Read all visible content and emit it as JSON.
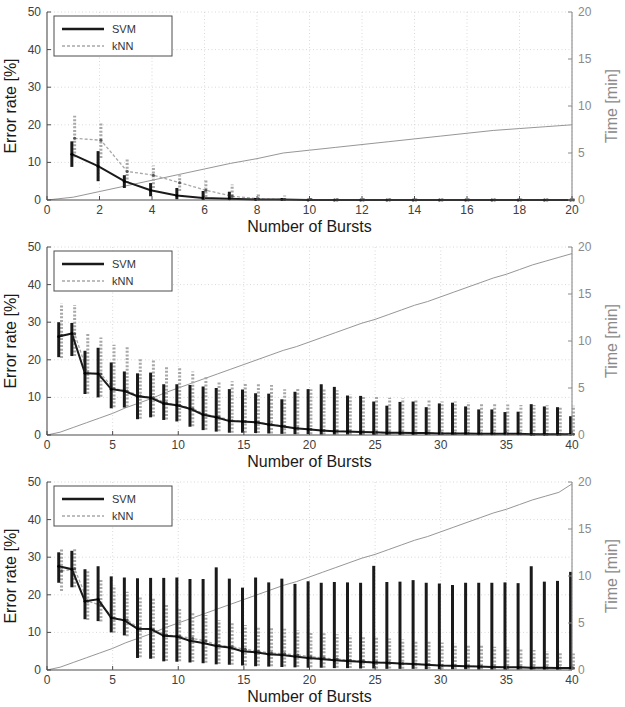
{
  "figure": {
    "panel_count": 3,
    "colors": {
      "svm": "#1a1a1a",
      "knn": "#a8a8a8",
      "time_line": "#8a8a8a",
      "grid": "#cfcfcf",
      "axis": "#4d4d4d",
      "right_axis_text": "#8a8a8a",
      "background": "#ffffff"
    }
  },
  "legend": {
    "entries": [
      {
        "label": "SVM",
        "style": "solid-thick",
        "color": "#1a1a1a"
      },
      {
        "label": "kNN",
        "style": "dashed-thin",
        "color": "#a8a8a8"
      }
    ]
  },
  "axes": {
    "ylabel": "Error rate [%]",
    "xlabel": "Number of Bursts",
    "ylabel_right": "Time [min]",
    "yticks": [
      "0",
      "10",
      "20",
      "30",
      "40",
      "50"
    ],
    "yticks_right": [
      "0",
      "5",
      "10",
      "15",
      "20"
    ],
    "ylim": [
      0,
      50
    ],
    "ylim_right": [
      0,
      20
    ]
  },
  "chart_data": [
    {
      "type": "line",
      "panel_index": 0,
      "title": "",
      "xlabel": "Number of Bursts",
      "ylabel": "Error rate [%]",
      "ylabel_right": "Time [min]",
      "xlim": [
        0,
        20
      ],
      "ylim": [
        0,
        50
      ],
      "ylim_right": [
        0,
        20
      ],
      "xticks": [
        0,
        2,
        4,
        6,
        8,
        10,
        12,
        14,
        16,
        18,
        20
      ],
      "yticks": [
        0,
        10,
        20,
        30,
        40,
        50
      ],
      "yticks_right": [
        0,
        5,
        10,
        15,
        20
      ],
      "grid": true,
      "legend_position": "top-left",
      "x": [
        1,
        2,
        3,
        4,
        5,
        6,
        7,
        8,
        9,
        10,
        11,
        12,
        13,
        14,
        15,
        16,
        17,
        18,
        19,
        20
      ],
      "series": [
        {
          "name": "SVM",
          "color": "#1a1a1a",
          "values": [
            12.2,
            9.0,
            5.0,
            2.6,
            1.2,
            0.5,
            0.3,
            0.1,
            0.1,
            0.0,
            0.0,
            0.0,
            0.0,
            0.0,
            0.0,
            0.0,
            0.0,
            0.0,
            0.0,
            0.0
          ],
          "err_low": [
            8.8,
            5.0,
            3.2,
            1.0,
            0.2,
            0.0,
            0.0,
            0.0,
            0.0,
            0.0,
            0.0,
            0.0,
            0.0,
            0.0,
            0.0,
            0.0,
            0.0,
            0.0,
            0.0,
            0.0
          ],
          "err_high": [
            15.6,
            13.0,
            6.6,
            4.5,
            3.2,
            2.4,
            2.2,
            0.5,
            0.4,
            0.3,
            0.2,
            0.2,
            0.2,
            0.2,
            0.2,
            0.2,
            0.2,
            0.2,
            0.2,
            0.2
          ]
        },
        {
          "name": "kNN",
          "color": "#a8a8a8",
          "values": [
            16.4,
            15.9,
            7.6,
            6.6,
            4.6,
            2.6,
            1.0,
            0.3,
            0.1,
            0.1,
            0.0,
            0.0,
            0.0,
            0.0,
            0.0,
            0.0,
            0.0,
            0.0,
            0.0,
            0.0
          ],
          "err_low": [
            11.4,
            11.2,
            4.5,
            3.2,
            2.4,
            0.8,
            0.1,
            0.0,
            0.0,
            0.0,
            0.0,
            0.0,
            0.0,
            0.0,
            0.0,
            0.0,
            0.0,
            0.0,
            0.0,
            0.0
          ],
          "err_high": [
            22.4,
            20.6,
            10.9,
            9.2,
            6.6,
            5.6,
            4.1,
            1.9,
            1.2,
            0.9,
            0.6,
            0.5,
            0.5,
            0.4,
            0.4,
            0.4,
            0.4,
            0.4,
            0.4,
            0.4
          ]
        },
        {
          "name": "Time",
          "color": "#8a8a8a",
          "axis": "right",
          "values": [
            0.3,
            0.9,
            1.5,
            2.1,
            2.7,
            3.3,
            3.9,
            4.4,
            5.0,
            5.3,
            5.6,
            5.9,
            6.2,
            6.5,
            6.8,
            7.1,
            7.4,
            7.6,
            7.8,
            8.0
          ]
        }
      ]
    },
    {
      "type": "line",
      "panel_index": 1,
      "title": "",
      "xlabel": "Number of Bursts",
      "ylabel": "Error rate [%]",
      "ylabel_right": "Time [min]",
      "xlim": [
        0,
        40
      ],
      "ylim": [
        0,
        50
      ],
      "ylim_right": [
        0,
        20
      ],
      "xticks": [
        0,
        5,
        10,
        15,
        20,
        25,
        30,
        35,
        40
      ],
      "yticks": [
        0,
        10,
        20,
        30,
        40,
        50
      ],
      "yticks_right": [
        0,
        5,
        10,
        15,
        20
      ],
      "grid": true,
      "legend_position": "top-left",
      "x": [
        1,
        2,
        3,
        4,
        5,
        6,
        7,
        8,
        9,
        10,
        11,
        12,
        13,
        14,
        15,
        16,
        17,
        18,
        19,
        20,
        21,
        22,
        23,
        24,
        25,
        26,
        27,
        28,
        29,
        30,
        31,
        32,
        33,
        34,
        35,
        36,
        37,
        38,
        39,
        40
      ],
      "series": [
        {
          "name": "SVM",
          "color": "#1a1a1a",
          "values": [
            26.2,
            27.0,
            16.4,
            16.3,
            12.2,
            11.7,
            10.3,
            9.9,
            8.4,
            7.9,
            7.0,
            5.4,
            4.7,
            3.7,
            3.6,
            3.4,
            2.8,
            2.3,
            1.8,
            1.5,
            1.2,
            1.0,
            0.9,
            0.8,
            0.7,
            0.6,
            0.6,
            0.5,
            0.5,
            0.4,
            0.4,
            0.4,
            0.3,
            0.3,
            0.3,
            0.3,
            0.2,
            0.2,
            0.2,
            0.2
          ],
          "err_low": [
            20.7,
            21.0,
            10.9,
            10.0,
            7.1,
            7.3,
            4.2,
            4.7,
            4.0,
            3.6,
            2.2,
            1.3,
            0.9,
            0.6,
            0.6,
            0.5,
            0.4,
            0.3,
            0.2,
            0.2,
            0.1,
            0.1,
            0.1,
            0.0,
            0.0,
            0.0,
            0.0,
            0.0,
            0.0,
            0.0,
            0.0,
            0.0,
            0.0,
            0.0,
            0.0,
            0.0,
            0.0,
            0.0,
            0.0,
            0.0
          ],
          "err_high": [
            30.0,
            29.8,
            22.4,
            23.2,
            19.3,
            16.9,
            16.4,
            16.6,
            13.5,
            13.5,
            13.3,
            12.9,
            12.5,
            12.2,
            12.1,
            11.1,
            11.0,
            9.5,
            11.5,
            12.2,
            13.5,
            12.8,
            10.5,
            10.4,
            8.9,
            7.8,
            8.8,
            8.9,
            7.4,
            8.4,
            8.6,
            7.6,
            6.8,
            6.8,
            6.1,
            6.2,
            8.2,
            7.6,
            7.4,
            5.0
          ]
        },
        {
          "name": "kNN",
          "color": "#a8a8a8",
          "values": [
            26.5,
            26.9,
            16.5,
            16.2,
            12.3,
            11.7,
            10.4,
            9.9,
            8.5,
            7.9,
            7.0,
            5.4,
            4.8,
            3.8,
            3.6,
            3.4,
            2.8,
            2.3,
            1.8,
            1.5,
            1.2,
            1.0,
            0.9,
            0.8,
            0.7,
            0.6,
            0.6,
            0.5,
            0.5,
            0.4,
            0.4,
            0.4,
            0.3,
            0.3,
            0.3,
            0.3,
            0.2,
            0.2,
            0.2,
            0.2
          ],
          "err_low": [
            20.5,
            21.0,
            11.0,
            10.2,
            7.4,
            7.5,
            4.3,
            4.9,
            4.1,
            3.8,
            2.3,
            1.4,
            1.0,
            0.6,
            0.6,
            0.5,
            0.4,
            0.3,
            0.2,
            0.2,
            0.1,
            0.1,
            0.1,
            0.0,
            0.0,
            0.0,
            0.0,
            0.0,
            0.0,
            0.0,
            0.0,
            0.0,
            0.0,
            0.0,
            0.0,
            0.0,
            0.0,
            0.0,
            0.0,
            0.0
          ],
          "err_high": [
            34.9,
            34.6,
            27.0,
            25.9,
            24.0,
            23.5,
            20.3,
            19.8,
            18.2,
            18.0,
            16.9,
            15.5,
            14.3,
            14.3,
            14.0,
            13.8,
            13.3,
            12.2,
            12.4,
            12.2,
            12.4,
            11.9,
            10.7,
            10.5,
            10.3,
            9.9,
            9.7,
            9.6,
            9.2,
            8.9,
            8.9,
            8.7,
            8.4,
            8.4,
            8.1,
            8.0,
            8.0,
            7.9,
            7.6,
            7.8
          ]
        },
        {
          "name": "Time",
          "color": "#8a8a8a",
          "axis": "right",
          "values": [
            0.3,
            0.8,
            1.3,
            1.8,
            2.3,
            2.9,
            3.4,
            3.9,
            4.5,
            5.0,
            5.5,
            6.0,
            6.5,
            7.0,
            7.5,
            8.0,
            8.5,
            9.0,
            9.4,
            9.9,
            10.4,
            10.9,
            11.4,
            11.9,
            12.3,
            12.8,
            13.3,
            13.8,
            14.2,
            14.7,
            15.2,
            15.7,
            16.2,
            16.7,
            17.1,
            17.6,
            18.1,
            18.5,
            18.9,
            19.3
          ]
        }
      ]
    },
    {
      "type": "line",
      "panel_index": 2,
      "title": "",
      "xlabel": "Number of Bursts",
      "ylabel": "Error rate [%]",
      "ylabel_right": "Time [min]",
      "xlim": [
        0,
        40
      ],
      "ylim": [
        0,
        50
      ],
      "ylim_right": [
        0,
        20
      ],
      "xticks": [
        0,
        5,
        10,
        15,
        20,
        25,
        30,
        35,
        40
      ],
      "yticks": [
        0,
        10,
        20,
        30,
        40,
        50
      ],
      "yticks_right": [
        0,
        5,
        10,
        15,
        20
      ],
      "grid": true,
      "legend_position": "top-left",
      "x": [
        1,
        2,
        3,
        4,
        5,
        6,
        7,
        8,
        9,
        10,
        11,
        12,
        13,
        14,
        15,
        16,
        17,
        18,
        19,
        20,
        21,
        22,
        23,
        24,
        25,
        26,
        27,
        28,
        29,
        30,
        31,
        32,
        33,
        34,
        35,
        36,
        37,
        38,
        39,
        40
      ],
      "series": [
        {
          "name": "SVM",
          "color": "#1a1a1a",
          "values": [
            27.6,
            26.8,
            18.3,
            18.8,
            13.9,
            13.2,
            11.0,
            10.9,
            9.1,
            8.9,
            7.8,
            7.2,
            6.4,
            6.0,
            5.0,
            4.7,
            4.2,
            4.0,
            3.6,
            3.2,
            2.9,
            2.6,
            2.4,
            2.2,
            2.0,
            1.9,
            1.7,
            1.6,
            1.4,
            1.2,
            1.1,
            1.0,
            0.9,
            0.8,
            0.7,
            0.7,
            0.6,
            0.6,
            0.5,
            0.5
          ],
          "err_low": [
            23.2,
            22.0,
            13.5,
            13.0,
            10.0,
            9.2,
            3.2,
            3.0,
            2.3,
            2.2,
            2.0,
            1.8,
            1.5,
            1.4,
            1.2,
            1.0,
            0.9,
            0.8,
            0.7,
            0.6,
            0.6,
            0.5,
            0.5,
            0.4,
            0.4,
            0.3,
            0.3,
            0.3,
            0.2,
            0.2,
            0.2,
            0.2,
            0.1,
            0.1,
            0.1,
            0.1,
            0.1,
            0.1,
            0.1,
            0.1
          ],
          "err_high": [
            31.3,
            31.7,
            26.8,
            27.6,
            24.9,
            24.6,
            24.4,
            24.5,
            24.5,
            24.6,
            24.2,
            24.2,
            27.3,
            24.3,
            21.9,
            24.6,
            23.3,
            24.3,
            22.9,
            23.6,
            23.2,
            23.4,
            23.3,
            23.2,
            27.7,
            23.4,
            23.5,
            23.9,
            23.2,
            23.0,
            22.6,
            23.2,
            23.2,
            23.2,
            23.3,
            23.1,
            27.6,
            23.5,
            23.7,
            26.1
          ]
        },
        {
          "name": "kNN",
          "color": "#a8a8a8",
          "values": [
            26.3,
            26.9,
            18.3,
            17.2,
            13.8,
            13.3,
            11.0,
            10.8,
            9.3,
            9.0,
            8.4,
            7.7,
            6.5,
            6.2,
            5.5,
            5.0,
            4.5,
            4.3,
            4.0,
            3.5,
            3.2,
            2.9,
            2.6,
            2.4,
            2.1,
            1.9,
            1.7,
            1.6,
            1.4,
            1.2,
            1.1,
            1.0,
            0.9,
            0.8,
            0.7,
            0.7,
            0.6,
            0.6,
            0.5,
            0.5
          ],
          "err_low": [
            21.0,
            22.0,
            13.3,
            12.9,
            9.9,
            9.0,
            3.4,
            3.1,
            2.4,
            2.3,
            2.1,
            1.9,
            1.6,
            1.4,
            1.2,
            1.1,
            1.0,
            0.9,
            0.8,
            0.7,
            0.6,
            0.6,
            0.5,
            0.5,
            0.4,
            0.4,
            0.3,
            0.3,
            0.3,
            0.2,
            0.2,
            0.2,
            0.2,
            0.1,
            0.1,
            0.1,
            0.1,
            0.1,
            0.1,
            0.1
          ],
          "err_high": [
            32.2,
            32.1,
            26.4,
            24.0,
            22.4,
            20.8,
            19.3,
            19.0,
            17.4,
            16.6,
            15.3,
            14.6,
            13.3,
            12.7,
            12.0,
            11.6,
            11.2,
            11.0,
            10.5,
            10.2,
            9.8,
            9.5,
            9.2,
            9.0,
            8.7,
            8.4,
            8.1,
            7.9,
            7.6,
            7.3,
            7.0,
            6.8,
            6.5,
            6.2,
            5.9,
            5.6,
            5.3,
            5.0,
            4.7,
            4.4
          ]
        },
        {
          "name": "Time",
          "color": "#8a8a8a",
          "axis": "right",
          "values": [
            0.3,
            0.8,
            1.3,
            1.8,
            2.3,
            2.9,
            3.4,
            3.9,
            4.5,
            5.0,
            5.5,
            6.0,
            6.5,
            7.0,
            7.5,
            8.0,
            8.5,
            9.0,
            9.4,
            9.9,
            10.4,
            10.9,
            11.4,
            11.9,
            12.3,
            12.8,
            13.3,
            13.8,
            14.2,
            14.7,
            15.2,
            15.7,
            16.2,
            16.7,
            17.1,
            17.6,
            18.1,
            18.5,
            18.9,
            19.8
          ]
        }
      ]
    }
  ]
}
